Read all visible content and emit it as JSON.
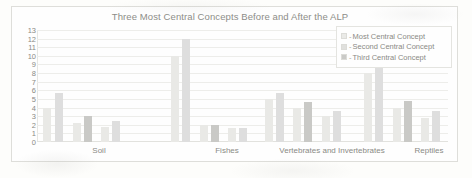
{
  "chart_data": {
    "type": "bar",
    "title": "Three Most Central Concepts Before and After the ALP",
    "xlabel": "",
    "ylabel": "",
    "ylim": [
      0,
      13
    ],
    "yticks": [
      0,
      1,
      2,
      3,
      4,
      5,
      6,
      7,
      8,
      9,
      10,
      11,
      12,
      13
    ],
    "grid": true,
    "legend_position": "top-right",
    "categories": [
      "Soil",
      "Fishes",
      "Vertebrates and Invertebrates",
      "Reptiles"
    ],
    "legend": [
      "Most Central Concept",
      "Second Central Concept",
      "Third Central Concept"
    ],
    "note": "Each series is plotted as a Before/After pair within every category group; the first bar of each pair is Before the ALP and the second is After the ALP.",
    "series": [
      {
        "name": "Most Central Concept",
        "before": [
          4,
          10,
          5,
          8
        ],
        "after": [
          5.7,
          12,
          5.7,
          9.3
        ]
      },
      {
        "name": "Second Central Concept",
        "before": [
          2.2,
          2,
          4,
          4
        ],
        "after": [
          3,
          2,
          4.6,
          4.8
        ]
      },
      {
        "name": "Third Central Concept",
        "before": [
          1.8,
          1.6,
          3,
          2.8
        ],
        "after": [
          2.4,
          1.6,
          3.6,
          3.6
        ]
      }
    ],
    "bars": [
      {
        "category": "Soil",
        "series": "Most Central Concept",
        "phase": "Before",
        "value": 4,
        "x": 6,
        "color": "#e9e9e6"
      },
      {
        "category": "Soil",
        "series": "Most Central Concept",
        "phase": "After",
        "value": 5.7,
        "x": 18,
        "color": "#dedede"
      },
      {
        "category": "Soil",
        "series": "Second Central Concept",
        "phase": "Before",
        "value": 2.2,
        "x": 36,
        "color": "#e9e9e6"
      },
      {
        "category": "Soil",
        "series": "Second Central Concept",
        "phase": "After",
        "value": 3,
        "x": 47,
        "color": "#c9c9c6"
      },
      {
        "category": "Soil",
        "series": "Third Central Concept",
        "phase": "Before",
        "value": 1.8,
        "x": 64,
        "color": "#e9e9e6"
      },
      {
        "category": "Soil",
        "series": "Third Central Concept",
        "phase": "After",
        "value": 2.4,
        "x": 75,
        "color": "#dedede"
      },
      {
        "category": "Fishes",
        "series": "Most Central Concept",
        "phase": "Before",
        "value": 10,
        "x": 134,
        "color": "#e9e9e6"
      },
      {
        "category": "Fishes",
        "series": "Most Central Concept",
        "phase": "After",
        "value": 12,
        "x": 145,
        "color": "#dedede"
      },
      {
        "category": "Fishes",
        "series": "Second Central Concept",
        "phase": "Before",
        "value": 2,
        "x": 163,
        "color": "#e9e9e6"
      },
      {
        "category": "Fishes",
        "series": "Second Central Concept",
        "phase": "After",
        "value": 2,
        "x": 174,
        "color": "#c9c9c6"
      },
      {
        "category": "Fishes",
        "series": "Third Central Concept",
        "phase": "Before",
        "value": 1.6,
        "x": 191,
        "color": "#e9e9e6"
      },
      {
        "category": "Fishes",
        "series": "Third Central Concept",
        "phase": "After",
        "value": 1.6,
        "x": 202,
        "color": "#dedede"
      },
      {
        "category": "Vertebrates and Invertebrates",
        "series": "Most Central Concept",
        "phase": "Before",
        "value": 5,
        "x": 228,
        "color": "#e9e9e6"
      },
      {
        "category": "Vertebrates and Invertebrates",
        "series": "Most Central Concept",
        "phase": "After",
        "value": 5.7,
        "x": 239,
        "color": "#dedede"
      },
      {
        "category": "Vertebrates and Invertebrates",
        "series": "Second Central Concept",
        "phase": "Before",
        "value": 4,
        "x": 256,
        "color": "#e9e9e6"
      },
      {
        "category": "Vertebrates and Invertebrates",
        "series": "Second Central Concept",
        "phase": "After",
        "value": 4.6,
        "x": 267,
        "color": "#c9c9c6"
      },
      {
        "category": "Vertebrates and Invertebrates",
        "series": "Third Central Concept",
        "phase": "Before",
        "value": 3,
        "x": 285,
        "color": "#e9e9e6"
      },
      {
        "category": "Vertebrates and Invertebrates",
        "series": "Third Central Concept",
        "phase": "After",
        "value": 3.6,
        "x": 296,
        "color": "#dedede"
      },
      {
        "category": "Reptiles",
        "series": "Most Central Concept",
        "phase": "Before",
        "value": 8,
        "x": 327,
        "color": "#e9e9e6"
      },
      {
        "category": "Reptiles",
        "series": "Most Central Concept",
        "phase": "After",
        "value": 9.3,
        "x": 338,
        "color": "#dedede"
      },
      {
        "category": "Reptiles",
        "series": "Second Central Concept",
        "phase": "Before",
        "value": 4,
        "x": 356,
        "color": "#e9e9e6"
      },
      {
        "category": "Reptiles",
        "series": "Second Central Concept",
        "phase": "After",
        "value": 4.8,
        "x": 367,
        "color": "#c9c9c6"
      },
      {
        "category": "Reptiles",
        "series": "Third Central Concept",
        "phase": "Before",
        "value": 2.8,
        "x": 384,
        "color": "#e9e9e6"
      },
      {
        "category": "Reptiles",
        "series": "Third Central Concept",
        "phase": "After",
        "value": 3.6,
        "x": 395,
        "color": "#dedede"
      }
    ],
    "category_label_x": [
      62,
      190,
      295,
      392
    ]
  }
}
